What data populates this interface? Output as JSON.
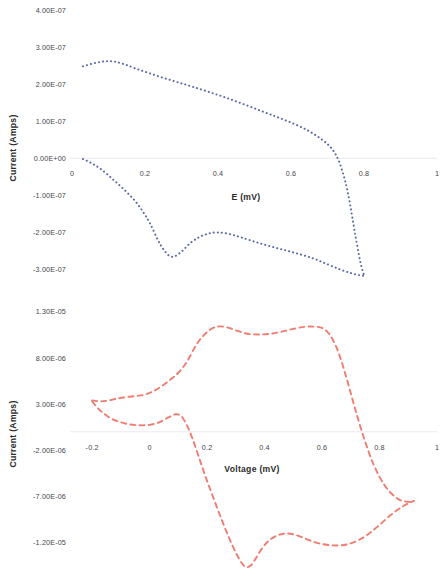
{
  "figure": {
    "background_color": "#ffffff",
    "panel_count": 2
  },
  "charts": [
    {
      "id": "top",
      "name": "cyclic-voltammogram-blue",
      "title": "",
      "xlabel": "E (mV)",
      "ylabel": "Current (Amps)",
      "x_ticks": [
        "0",
        "0.2",
        "0.4",
        "0.6",
        "0.8",
        "1"
      ],
      "y_ticks": [
        "4.00E-07",
        "3.00E-07",
        "2.00E-07",
        "1.00E-07",
        "0.00E+00",
        "-1.00E-07",
        "-2.00E-07",
        "-3.00E-07"
      ],
      "series_color": "#5b69a8",
      "line_style": "dotted"
    },
    {
      "id": "bottom",
      "name": "cyclic-voltammogram-red",
      "title": "",
      "xlabel": "Voltage (mV)",
      "ylabel": "Current (Amps)",
      "x_ticks": [
        "-0.2",
        "0",
        "0.2",
        "0.4",
        "0.6",
        "0.8",
        "1"
      ],
      "y_ticks": [
        "1.30E-05",
        "8.00E-06",
        "3.00E-06",
        "-2.00E-06",
        "-7.00E-06",
        "-1.20E-05"
      ],
      "series_color": "#ef7d72",
      "line_style": "dashed"
    }
  ],
  "chart_data": [
    {
      "type": "line",
      "id": "top",
      "title": "",
      "xlabel": "E (mV)",
      "ylabel": "Current (Amps)",
      "xlim": [
        0,
        1
      ],
      "ylim": [
        -3.5e-07,
        4e-07
      ],
      "x_tick_values": [
        0,
        0.2,
        0.4,
        0.6,
        0.8,
        1
      ],
      "x_tick_labels": [
        "0",
        "0.2",
        "0.4",
        "0.6",
        "0.8",
        "1"
      ],
      "y_tick_values": [
        4e-07,
        3e-07,
        2e-07,
        1e-07,
        0.0,
        -1e-07,
        -2e-07,
        -3e-07
      ],
      "y_tick_labels": [
        "4.00E-07",
        "3.00E-07",
        "2.00E-07",
        "1.00E-07",
        "0.00E+00",
        "-1.00E-07",
        "-2.00E-07",
        "-3.00E-07"
      ],
      "grid": false,
      "legend": null,
      "zero_line": true,
      "series": [
        {
          "name": "forward-sweep",
          "color": "#5b69a8",
          "style": "dotted",
          "x": [
            0.03,
            0.055,
            0.08,
            0.1,
            0.12,
            0.145,
            0.175,
            0.21,
            0.25,
            0.29,
            0.33,
            0.375,
            0.42,
            0.47,
            0.52,
            0.565,
            0.61,
            0.65,
            0.685,
            0.71,
            0.73,
            0.748,
            0.762,
            0.775,
            0.79,
            0.8
          ],
          "y": [
            2.48e-07,
            2.55e-07,
            2.6e-07,
            2.62e-07,
            2.6e-07,
            2.53e-07,
            2.42e-07,
            2.3e-07,
            2.17e-07,
            2.05e-07,
            1.93e-07,
            1.79e-07,
            1.64e-07,
            1.46e-07,
            1.27e-07,
            1.1e-07,
            9.2e-08,
            7.3e-08,
            5e-08,
            2.8e-08,
            -5e-09,
            -6e-08,
            -1.25e-07,
            -2e-07,
            -2.8e-07,
            -3.15e-07
          ]
        },
        {
          "name": "reverse-sweep",
          "color": "#5b69a8",
          "style": "dotted",
          "x": [
            0.03,
            0.055,
            0.08,
            0.11,
            0.14,
            0.17,
            0.195,
            0.215,
            0.235,
            0.25,
            0.265,
            0.28,
            0.3,
            0.325,
            0.35,
            0.375,
            0.4,
            0.43,
            0.465,
            0.51,
            0.56,
            0.61,
            0.66,
            0.7,
            0.735,
            0.765,
            0.79,
            0.8
          ],
          "y": [
            -2e-09,
            -1.4e-08,
            -3e-08,
            -5.5e-08,
            -8.2e-08,
            -1.12e-07,
            -1.45e-07,
            -1.78e-07,
            -2.2e-07,
            -2.45e-07,
            -2.62e-07,
            -2.65e-07,
            -2.52e-07,
            -2.28e-07,
            -2.12e-07,
            -2.03e-07,
            -2e-07,
            -2.04e-07,
            -2.14e-07,
            -2.28e-07,
            -2.42e-07,
            -2.55e-07,
            -2.7e-07,
            -2.86e-07,
            -3e-07,
            -3.1e-07,
            -3.16e-07,
            -3.17e-07
          ]
        }
      ]
    },
    {
      "type": "line",
      "id": "bottom",
      "title": "",
      "xlabel": "Voltage (mV)",
      "ylabel": "Current (Amps)",
      "xlim": [
        -0.27,
        1.0
      ],
      "ylim": [
        -1.65e-05,
        1.45e-05
      ],
      "x_tick_values": [
        -0.2,
        0,
        0.2,
        0.4,
        0.6,
        0.8,
        1
      ],
      "x_tick_labels": [
        "-0.2",
        "0",
        "0.2",
        "0.4",
        "0.6",
        "0.8",
        "1"
      ],
      "y_tick_values": [
        1.3e-05,
        8e-06,
        3e-06,
        -2e-06,
        -7e-06,
        -1.2e-05
      ],
      "y_tick_labels": [
        "1.30E-05",
        "8.00E-06",
        "3.00E-06",
        "-2.00E-06",
        "-7.00E-06",
        "-1.20E-05"
      ],
      "grid": false,
      "legend": null,
      "zero_line": true,
      "series": [
        {
          "name": "forward-sweep",
          "color": "#ef7d72",
          "style": "dashed",
          "x": [
            -0.2,
            -0.175,
            -0.15,
            -0.12,
            -0.09,
            -0.055,
            -0.02,
            0.01,
            0.04,
            0.07,
            0.1,
            0.13,
            0.16,
            0.185,
            0.21,
            0.235,
            0.265,
            0.3,
            0.34,
            0.38,
            0.42,
            0.46,
            0.5,
            0.54,
            0.57,
            0.6,
            0.625,
            0.648,
            0.668,
            0.69,
            0.715,
            0.745,
            0.78,
            0.82,
            0.865,
            0.905,
            0.92
          ],
          "y": [
            3.4e-06,
            3.3e-06,
            3.35e-06,
            3.55e-06,
            3.72e-06,
            3.85e-06,
            4e-06,
            4.35e-06,
            4.9e-06,
            5.6e-06,
            6.4e-06,
            7.6e-06,
            9.3e-06,
            1.035e-05,
            1.105e-05,
            1.14e-05,
            1.135e-05,
            1.1e-05,
            1.062e-05,
            1.055e-05,
            1.062e-05,
            1.085e-05,
            1.115e-05,
            1.138e-05,
            1.14e-05,
            1.125e-05,
            1.06e-05,
            9.3e-06,
            7.6e-06,
            5.3e-06,
            2.5e-06,
            -6e-07,
            -3.6e-06,
            -5.9e-06,
            -7.3e-06,
            -7.6e-06,
            -7.55e-06
          ]
        },
        {
          "name": "reverse-sweep",
          "color": "#ef7d72",
          "style": "dashed",
          "x": [
            -0.2,
            -0.18,
            -0.16,
            -0.135,
            -0.105,
            -0.07,
            -0.035,
            0.0,
            0.035,
            0.065,
            0.09,
            0.11,
            0.13,
            0.15,
            0.172,
            0.195,
            0.22,
            0.248,
            0.275,
            0.3,
            0.32,
            0.335,
            0.352,
            0.37,
            0.392,
            0.415,
            0.44,
            0.465,
            0.49,
            0.52,
            0.555,
            0.59,
            0.625,
            0.66,
            0.695,
            0.73,
            0.765,
            0.8,
            0.84,
            0.88,
            0.92
          ],
          "y": [
            3.3e-06,
            2.55e-06,
            2e-06,
            1.45e-06,
            1.08e-06,
            8e-07,
            7e-07,
            7.5e-07,
            1.05e-06,
            1.55e-06,
            1.9e-06,
            1.7e-06,
            7e-07,
            -8e-07,
            -2.8e-06,
            -4.9e-06,
            -7e-06,
            -9.3e-06,
            -1.14e-05,
            -1.31e-05,
            -1.42e-05,
            -1.465e-05,
            -1.45e-05,
            -1.37e-05,
            -1.26e-05,
            -1.18e-05,
            -1.13e-05,
            -1.105e-05,
            -1.105e-05,
            -1.13e-05,
            -1.175e-05,
            -1.21e-05,
            -1.228e-05,
            -1.232e-05,
            -1.215e-05,
            -1.17e-05,
            -1.1e-05,
            -1.01e-05,
            -9e-06,
            -8.1e-06,
            -7.5e-06
          ]
        }
      ]
    }
  ]
}
